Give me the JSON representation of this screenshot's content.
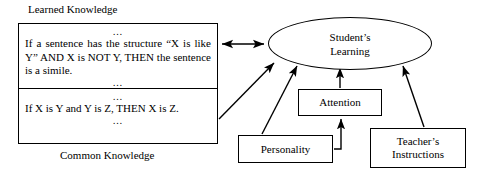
{
  "diagram": {
    "captions": {
      "learned_knowledge": "Learned Knowledge",
      "common_knowledge": "Common Knowledge"
    },
    "knowledge_box": {
      "learned_section": {
        "ellipsis_top": "…",
        "rule": "If a sentence has the structure “X is like Y” AND X is NOT Y, THEN the sentence is a simile.",
        "ellipsis_bottom": "…"
      },
      "common_section": {
        "ellipsis_top": "…",
        "rule": "If X is Y and Y is Z, THEN X is Z.",
        "ellipsis_bottom": "…"
      }
    },
    "nodes": {
      "student_learning_line1": "Student’s",
      "student_learning_line2": "Learning",
      "attention": "Attention",
      "personality": "Personality",
      "teacher_line1": "Teacher’s",
      "teacher_line2": "Instructions"
    },
    "edges": [
      {
        "name": "knowledge-to-student",
        "style": "double-arrow",
        "from": "knowledge-box",
        "to": "student-learning"
      },
      {
        "name": "common-knowledge-to-student",
        "style": "arrow",
        "from": "knowledge-box",
        "to": "student-learning"
      },
      {
        "name": "personality-to-student",
        "style": "arrow",
        "from": "personality",
        "to": "student-learning"
      },
      {
        "name": "attention-to-student",
        "style": "arrow",
        "from": "attention",
        "to": "student-learning"
      },
      {
        "name": "teacher-to-student",
        "style": "arrow",
        "from": "teacher-instructions",
        "to": "student-learning"
      },
      {
        "name": "personality-to-attention",
        "style": "elbow-arrow",
        "from": "personality",
        "to": "attention"
      }
    ],
    "colors": {
      "stroke": "#000000",
      "background": "#ffffff"
    }
  }
}
